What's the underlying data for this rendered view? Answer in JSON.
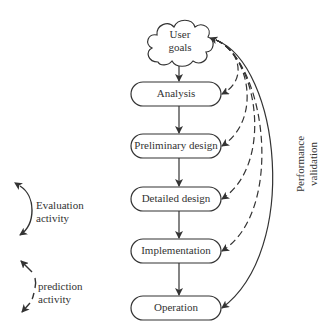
{
  "diagram": {
    "nodes": [
      {
        "id": "user-goals",
        "label_line1": "User",
        "label_line2": "goals",
        "shape": "cloud"
      },
      {
        "id": "analysis",
        "label": "Analysis",
        "shape": "rounded-rect"
      },
      {
        "id": "preliminary-design",
        "label": "Preliminary design",
        "shape": "rounded-rect"
      },
      {
        "id": "detailed-design",
        "label": "Detailed design",
        "shape": "rounded-rect"
      },
      {
        "id": "implementation",
        "label": "Implementation",
        "shape": "rounded-rect"
      },
      {
        "id": "operation",
        "label": "Operation",
        "shape": "rounded-rect"
      }
    ],
    "edges": [
      {
        "from": "user-goals",
        "to": "analysis",
        "style": "solid"
      },
      {
        "from": "analysis",
        "to": "preliminary-design",
        "style": "solid"
      },
      {
        "from": "preliminary-design",
        "to": "detailed-design",
        "style": "solid"
      },
      {
        "from": "detailed-design",
        "to": "implementation",
        "style": "solid"
      },
      {
        "from": "implementation",
        "to": "operation",
        "style": "solid"
      },
      {
        "from": "user-goals",
        "to": "analysis",
        "style": "dashed",
        "type": "prediction"
      },
      {
        "from": "user-goals",
        "to": "preliminary-design",
        "style": "dashed",
        "type": "prediction"
      },
      {
        "from": "user-goals",
        "to": "detailed-design",
        "style": "dashed",
        "type": "prediction"
      },
      {
        "from": "user-goals",
        "to": "implementation",
        "style": "dashed",
        "type": "prediction"
      },
      {
        "from": "user-goals",
        "to": "operation",
        "style": "solid",
        "type": "evaluation",
        "bidirectional": true
      }
    ],
    "side_label_line1": "Performance",
    "side_label_line2": "validation",
    "legend": {
      "evaluation_line1": "Evaluation",
      "evaluation_line2": "activity",
      "prediction_line1": "prediction",
      "prediction_line2": "activity"
    },
    "colors": {
      "stroke": "#333333",
      "background": "#ffffff"
    }
  }
}
